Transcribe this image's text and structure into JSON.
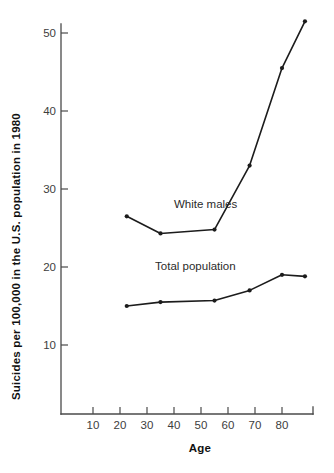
{
  "chart_data": {
    "type": "line",
    "title": "",
    "xlabel": "Age",
    "ylabel": "Suicides per 100,000 in the U.S. population in 1980",
    "xlim": [
      0,
      93
    ],
    "ylim": [
      0,
      53
    ],
    "xticks": [
      10,
      20,
      30,
      40,
      50,
      60,
      70,
      80
    ],
    "xtick_labels": [
      "10",
      "20",
      "30",
      "40",
      "50",
      "60",
      "70",
      "80"
    ],
    "yticks": [
      10,
      20,
      30,
      40,
      50
    ],
    "ytick_labels": [
      "10",
      "20",
      "30",
      "40",
      "50"
    ],
    "grid": false,
    "legend_position": "inline-annotation",
    "series": [
      {
        "name": "White males",
        "label_text": "White males",
        "color": "#1c1c1c",
        "x": [
          22.5,
          35.0,
          55.0,
          68.0,
          80.0,
          88.5
        ],
        "values": [
          26.5,
          24.3,
          24.8,
          33.0,
          45.5,
          51.5
        ]
      },
      {
        "name": "Total population",
        "label_text": "Total population",
        "color": "#1c1c1c",
        "x": [
          22.5,
          35.0,
          55.0,
          68.0,
          80.0,
          88.5
        ],
        "values": [
          15.0,
          15.5,
          15.7,
          17.0,
          19.0,
          18.8
        ]
      }
    ],
    "annotations": [
      {
        "text": "White males",
        "x": 40.0,
        "y": 27.6
      },
      {
        "text": "Total population",
        "x": 33.0,
        "y": 19.6
      }
    ]
  },
  "colors": {
    "background": "#ffffff",
    "ink": "#1c1c1c",
    "axis": "#4a4a4a",
    "tick_text": "#3d3d3d",
    "title_text": "#111111"
  }
}
